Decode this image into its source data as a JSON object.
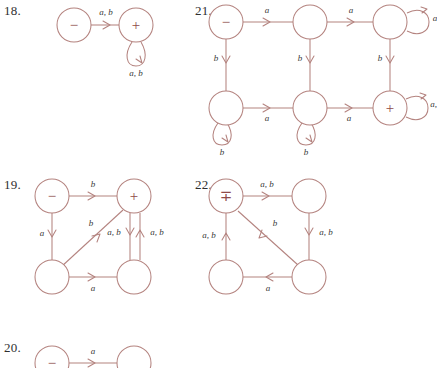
{
  "page": {
    "background_color": "#ffffff",
    "stroke_color": "#b4837f",
    "label_color": "#3a3a3a",
    "number_color": "#2f2f2f"
  },
  "problems": [
    {
      "id": "18",
      "number_label": "18.",
      "nodes": [
        {
          "name": "start-state",
          "glyph": "−"
        },
        {
          "name": "accept-state",
          "glyph": "+"
        }
      ],
      "edges": [
        {
          "name": "start-to-accept",
          "label": "a, b"
        },
        {
          "name": "accept-self-loop",
          "label": "a, b"
        }
      ]
    },
    {
      "id": "19",
      "number_label": "19.",
      "nodes": [
        {
          "name": "start-state",
          "glyph": "−"
        },
        {
          "name": "accept-state",
          "glyph": "+"
        },
        {
          "name": "lower-left-state",
          "glyph": ""
        },
        {
          "name": "lower-right-state",
          "glyph": ""
        }
      ],
      "edges": [
        {
          "name": "start-to-accept",
          "label": "b"
        },
        {
          "name": "start-to-lower-left",
          "label": "a"
        },
        {
          "name": "lower-left-to-accept-diagonal",
          "label": "b"
        },
        {
          "name": "accept-to-lower-right",
          "label": "a, b"
        },
        {
          "name": "lower-right-to-accept",
          "label": "a, b"
        },
        {
          "name": "lower-left-to-lower-right",
          "label": "a"
        }
      ]
    },
    {
      "id": "20",
      "number_label": "20.",
      "nodes": [
        {
          "name": "start-state",
          "glyph": "−"
        },
        {
          "name": "right-state",
          "glyph": ""
        }
      ],
      "edges": [
        {
          "name": "start-to-right",
          "label": "a"
        }
      ]
    },
    {
      "id": "21",
      "number_label": "21.",
      "nodes": [
        {
          "name": "start-state",
          "glyph": "−"
        },
        {
          "name": "top-middle-state",
          "glyph": ""
        },
        {
          "name": "top-right-state",
          "glyph": ""
        },
        {
          "name": "bottom-left-state",
          "glyph": ""
        },
        {
          "name": "bottom-middle-state",
          "glyph": ""
        },
        {
          "name": "accept-state",
          "glyph": "+"
        }
      ],
      "edges": [
        {
          "name": "start-to-top-middle",
          "label": "a"
        },
        {
          "name": "top-middle-to-top-right",
          "label": "a"
        },
        {
          "name": "top-right-self-loop",
          "label": "a"
        },
        {
          "name": "start-to-bottom-left",
          "label": "b"
        },
        {
          "name": "top-middle-to-bottom-middle",
          "label": "b"
        },
        {
          "name": "top-right-to-accept",
          "label": "b"
        },
        {
          "name": "bottom-left-to-bottom-middle",
          "label": "a"
        },
        {
          "name": "bottom-middle-to-accept",
          "label": "a"
        },
        {
          "name": "bottom-left-self-loop",
          "label": "b"
        },
        {
          "name": "bottom-middle-self-loop",
          "label": "b"
        },
        {
          "name": "accept-self-loop",
          "label": "a, b"
        }
      ]
    },
    {
      "id": "22",
      "number_label": "22.",
      "nodes": [
        {
          "name": "start-accept-state",
          "glyph": "∓"
        },
        {
          "name": "top-right-state",
          "glyph": ""
        },
        {
          "name": "bottom-left-state",
          "glyph": ""
        },
        {
          "name": "bottom-right-state",
          "glyph": ""
        }
      ],
      "edges": [
        {
          "name": "start-to-top-right",
          "label": "a, b"
        },
        {
          "name": "top-right-to-bottom-right",
          "label": "a, b"
        },
        {
          "name": "bottom-right-to-start-diagonal",
          "label": "b"
        },
        {
          "name": "bottom-right-to-bottom-left",
          "label": "a"
        },
        {
          "name": "bottom-left-to-start",
          "label": "a, b"
        }
      ]
    }
  ]
}
